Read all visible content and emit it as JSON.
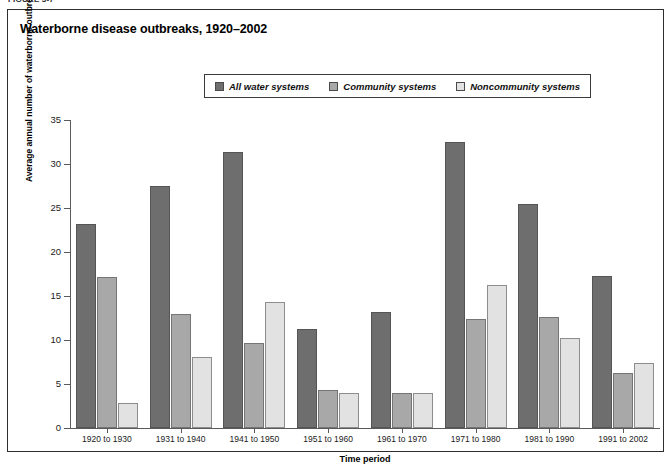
{
  "figure_caption": "FIGURE 3-7",
  "chart_title": "Waterborne disease outbreaks, 1920–2002",
  "colors": {
    "series_all": "#6e6e6e",
    "series_community": "#a8a8a8",
    "series_noncommunity": "#e2e2e2",
    "axis": "#5a5a5a",
    "border": "#2e2e2e"
  },
  "legend": {
    "position": "top-center",
    "items": [
      {
        "label": "All water systems",
        "swatch_icon": "legend-swatch-dark",
        "color": "#6e6e6e"
      },
      {
        "label": "Community systems",
        "swatch_icon": "legend-swatch-mid",
        "color": "#a8a8a8"
      },
      {
        "label": "Noncommunity systems",
        "swatch_icon": "legend-swatch-light",
        "color": "#e2e2e2"
      }
    ]
  },
  "chart_data": {
    "type": "bar",
    "title": "Waterborne disease outbreaks, 1920–2002",
    "xlabel": "Time period",
    "ylabel": "Average annual number of waterborne outbreaks",
    "categories": [
      "1920 to 1930",
      "1931 to 1940",
      "1941 to 1950",
      "1951 to 1960",
      "1961 to 1970",
      "1971 to 1980",
      "1981 to 1990",
      "1991 to 2002"
    ],
    "series": [
      {
        "name": "All water systems",
        "color": "#6e6e6e",
        "values": [
          23.2,
          27.5,
          31.4,
          11.2,
          13.2,
          32.5,
          25.5,
          17.3
        ]
      },
      {
        "name": "Community systems",
        "color": "#a8a8a8",
        "values": [
          17.2,
          12.9,
          9.7,
          4.3,
          4.0,
          12.4,
          12.6,
          6.3
        ]
      },
      {
        "name": "Noncommunity systems",
        "color": "#e2e2e2",
        "values": [
          2.8,
          8.1,
          14.3,
          4.0,
          4.0,
          16.2,
          10.2,
          7.4
        ]
      }
    ],
    "ylim": [
      0,
      35
    ],
    "yticks": [
      0,
      5,
      10,
      15,
      20,
      25,
      30,
      35
    ],
    "grid": false,
    "legend_position": "top-center"
  }
}
